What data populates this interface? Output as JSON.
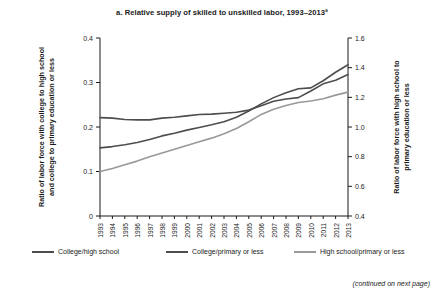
{
  "chart_data": {
    "type": "line",
    "title": "a. Relative supply of skilled to unskilled labor, 1993–2013ª",
    "xlabel": "",
    "ylabel": "Ratio of labor force with college to high school and college to primary education or less",
    "y2label": "Ratio of labor force with high school to primary education or less",
    "grid": false,
    "legend_position": "bottom",
    "x": [
      "1993",
      "1994",
      "1995",
      "1996",
      "1997",
      "1998",
      "1999",
      "2000",
      "2001",
      "2002",
      "2003",
      "2004",
      "2005",
      "2006",
      "2007",
      "2008",
      "2009",
      "2010",
      "2011",
      "2012",
      "2013"
    ],
    "yticks": [
      "0",
      "0.1",
      "0.2",
      "0.3",
      "0.4"
    ],
    "ylim": [
      0,
      0.4
    ],
    "y2ticks": [
      "0.4",
      "0.6",
      "0.8",
      "1.0",
      "1.2",
      "1.4",
      "1.6"
    ],
    "y2lim": [
      0.4,
      1.6
    ],
    "series": [
      {
        "name": "College/high school",
        "axis": "left",
        "color": "#4d4d4d",
        "values": [
          0.221,
          0.22,
          0.217,
          0.216,
          0.216,
          0.22,
          0.222,
          0.225,
          0.228,
          0.229,
          0.231,
          0.233,
          0.238,
          0.248,
          0.258,
          0.263,
          0.266,
          0.281,
          0.297,
          0.305,
          0.318
        ]
      },
      {
        "name": "College/primary or less",
        "axis": "left",
        "color": "#4d4d4d",
        "values": [
          0.153,
          0.156,
          0.16,
          0.165,
          0.172,
          0.18,
          0.186,
          0.193,
          0.199,
          0.205,
          0.212,
          0.222,
          0.236,
          0.252,
          0.266,
          0.277,
          0.286,
          0.288,
          0.304,
          0.323,
          0.34
        ]
      },
      {
        "name": "High school/primary or less",
        "axis": "right",
        "color": "#999999",
        "values": [
          0.7,
          0.72,
          0.745,
          0.77,
          0.8,
          0.825,
          0.85,
          0.875,
          0.9,
          0.925,
          0.955,
          0.99,
          1.035,
          1.085,
          1.12,
          1.145,
          1.165,
          1.175,
          1.19,
          1.215,
          1.235
        ]
      }
    ],
    "legend": [
      {
        "label": "College/high school",
        "color": "#4d4d4d"
      },
      {
        "label": "College/primary or less",
        "color": "#4d4d4d"
      },
      {
        "label": "High school/primary or less",
        "color": "#999999"
      }
    ],
    "note": "(continued on next page)"
  }
}
